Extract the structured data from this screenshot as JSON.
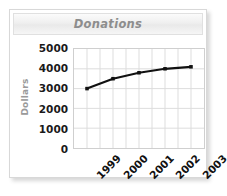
{
  "widget": {
    "title": "Donations"
  },
  "chart_data": {
    "type": "line",
    "title": "Donations",
    "xlabel": "",
    "ylabel": "Dollars",
    "categories": [
      "1999",
      "2000",
      "2001",
      "2002",
      "2003"
    ],
    "values": [
      3000,
      3500,
      3800,
      4000,
      4100
    ],
    "series": [
      {
        "name": "Donations",
        "values": [
          3000,
          3500,
          3800,
          4000,
          4100
        ]
      }
    ],
    "ylim": [
      0,
      5000
    ],
    "y_ticks": [
      "5000",
      "4000",
      "3000",
      "2000",
      "1000",
      "0"
    ],
    "y_tick_values": [
      5000,
      4000,
      3000,
      2000,
      1000,
      0
    ],
    "grid": true,
    "legend": "none",
    "line_color": "#111111",
    "grid_color": "#dcdcdc",
    "marker": "square"
  },
  "colors": {
    "title_text": "#8d8d8d",
    "axis_label_text": "#9a9a9a",
    "tick_text": "#111111",
    "line": "#111111",
    "grid": "#dcdcdc",
    "frame": "#cfcfcf",
    "widget_border": "#d8d8d8",
    "background": "#ffffff"
  }
}
